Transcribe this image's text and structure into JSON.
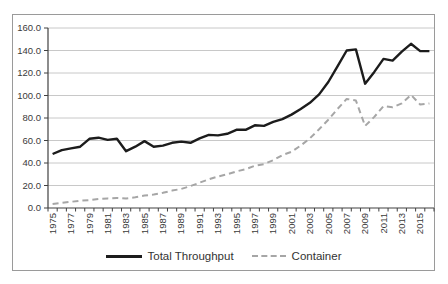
{
  "figure": {
    "background": "#ffffff",
    "border_color": "#9a9a9a"
  },
  "chart_data": {
    "type": "line",
    "title": "",
    "xlabel": "",
    "ylabel": "",
    "x": [
      1975,
      1976,
      1977,
      1978,
      1979,
      1980,
      1981,
      1982,
      1983,
      1984,
      1985,
      1986,
      1987,
      1988,
      1989,
      1990,
      1991,
      1992,
      1993,
      1994,
      1995,
      1996,
      1997,
      1998,
      1999,
      2000,
      2001,
      2002,
      2003,
      2004,
      2005,
      2006,
      2007,
      2008,
      2009,
      2010,
      2011,
      2012,
      2013,
      2014,
      2015,
      2016
    ],
    "x_tick_labels": [
      "1975",
      "1977",
      "1979",
      "1981",
      "1983",
      "1985",
      "1987",
      "1989",
      "1991",
      "1993",
      "1995",
      "1997",
      "1999",
      "2001",
      "2003",
      "2005",
      "2007",
      "2009",
      "2011",
      "2013",
      "2015"
    ],
    "y_tick_labels": [
      "0.0",
      "20.0",
      "40.0",
      "60.0",
      "80.0",
      "100.0",
      "120.0",
      "140.0",
      "160.0"
    ],
    "ylim": [
      0,
      160
    ],
    "ytick_step": 20,
    "grid": "horizontal",
    "legend_position": "bottom",
    "gridline_color": "#c8c8c8",
    "axis_color": "#404040",
    "text_color": "#3a3a3a",
    "series": [
      {
        "name": "Total Throughput",
        "style": "solid",
        "color": "#1c1c1c",
        "values": [
          48,
          51.5,
          53,
          54.5,
          61.5,
          62.5,
          60.5,
          61.5,
          50.5,
          54.5,
          59.5,
          54.5,
          55.5,
          58,
          59,
          58,
          62,
          65,
          64.5,
          66,
          69.5,
          69.5,
          73.5,
          73,
          76.5,
          79,
          83,
          88,
          93.5,
          101,
          112,
          126,
          140,
          141,
          110.5,
          121,
          132.5,
          131,
          139,
          146,
          139.5,
          139.5
        ]
      },
      {
        "name": "Container",
        "style": "dashed",
        "color": "#a6a6a6",
        "values": [
          3.5,
          4.5,
          5.5,
          6.5,
          7,
          8,
          8.5,
          9,
          8.5,
          9.5,
          11,
          12,
          13.5,
          15.5,
          17,
          19.5,
          22.5,
          25.5,
          28,
          30,
          32.5,
          34.5,
          37.5,
          39,
          42.5,
          47,
          50,
          55.5,
          62,
          70,
          78.5,
          88,
          97,
          95.5,
          73,
          81,
          90.5,
          89.5,
          93,
          100.5,
          92,
          93
        ]
      }
    ]
  }
}
